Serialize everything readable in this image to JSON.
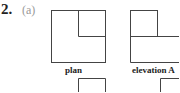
{
  "question": {
    "number": "2.",
    "part": "(a)"
  },
  "figures": [
    {
      "caption": "plan"
    },
    {
      "caption": "elevation A"
    }
  ]
}
